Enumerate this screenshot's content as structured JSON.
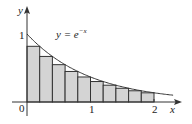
{
  "chart_data": {
    "type": "bar",
    "title": "",
    "function_label": "y = e^{-x}",
    "xlabel": "x",
    "ylabel": "y",
    "x_ticks": [
      "0",
      "1",
      "2"
    ],
    "y_ticks": [
      "1"
    ],
    "xlim": [
      0,
      2.3
    ],
    "ylim": [
      0,
      1.1
    ],
    "grid": false,
    "rectangles": {
      "description": "Lower Riemann sum (right endpoints), n = 10, width 0.2",
      "x_left": [
        0,
        0.2,
        0.4,
        0.6,
        0.8,
        1.0,
        1.2,
        1.4,
        1.6,
        1.8
      ],
      "heights": [
        0.819,
        0.67,
        0.549,
        0.449,
        0.368,
        0.301,
        0.247,
        0.202,
        0.165,
        0.135
      ]
    },
    "curve": {
      "name": "y = e^{-x}",
      "x_range": [
        0,
        2.3
      ]
    },
    "colors": {
      "fill": "#d4d4d4",
      "stroke": "#333333",
      "axis": "#333333"
    }
  },
  "labels": {
    "y_axis": "y",
    "x_axis": "x",
    "func_prefix": "y = e",
    "func_exp": "−x",
    "x0": "0",
    "x1": "1",
    "x2": "2",
    "y1": "1"
  }
}
